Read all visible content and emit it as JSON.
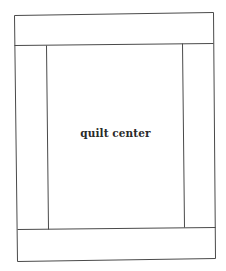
{
  "diagram": {
    "type": "quilt-layout",
    "center_label": "quilt center",
    "line_color": "#4a4a4a",
    "background": "#ffffff",
    "regions": [
      {
        "name": "top-border",
        "label": ""
      },
      {
        "name": "left-border",
        "label": ""
      },
      {
        "name": "quilt-center",
        "label": "quilt center"
      },
      {
        "name": "right-border",
        "label": ""
      },
      {
        "name": "bottom-border",
        "label": ""
      }
    ]
  }
}
